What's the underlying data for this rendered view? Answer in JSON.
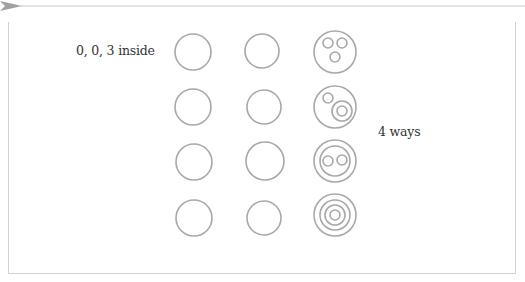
{
  "labels": {
    "left": "0, 0, 3 inside",
    "right": "4 ways"
  },
  "colors": {
    "stroke": "#a8a8a8",
    "text": "#333333",
    "frame": "#d2d2d2",
    "arrow": "#a0a0a0"
  },
  "grid": {
    "columns": 3,
    "rows": 4,
    "plain_columns": [
      1,
      2
    ],
    "nested_column": 3
  },
  "nested_patterns": [
    {
      "row": 1,
      "description": "outer circle containing three separate small circles"
    },
    {
      "row": 2,
      "description": "outer circle containing one small circle and one circle that contains another circle"
    },
    {
      "row": 3,
      "description": "outer circle containing a circle that contains two small circles"
    },
    {
      "row": 4,
      "description": "four concentric circles"
    }
  ]
}
